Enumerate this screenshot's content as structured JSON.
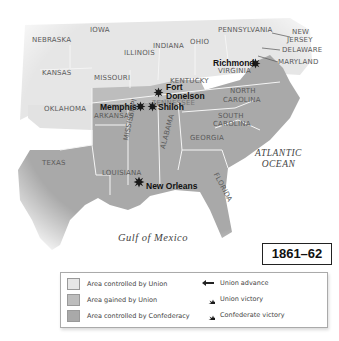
{
  "map": {
    "year_label": "1861–62",
    "colors": {
      "union": "#e6e6e6",
      "gained": "#bdbdbd",
      "confederacy": "#a9a9a9",
      "border": "#ffffff",
      "water": "#ffffff"
    },
    "states": {
      "nebraska": "NEBRASKA",
      "iowa": "IOWA",
      "illinois": "ILLINOIS",
      "indiana": "INDIANA",
      "ohio": "OHIO",
      "pennsylvania": "PENNSYLVANIA",
      "new_jersey_1": "NEW",
      "new_jersey_2": "JERSEY",
      "delaware": "DELAWARE",
      "maryland": "MARYLAND",
      "kansas": "KANSAS",
      "missouri": "MISSOURI",
      "kentucky": "KENTUCKY",
      "virginia": "VIRGINIA",
      "tennessee": "TENNESSEE",
      "north_carolina_1": "NORTH",
      "north_carolina_2": "CAROLINA",
      "oklahoma": "OKLAHOMA",
      "arkansas": "ARKANSAS",
      "south_carolina_1": "SOUTH",
      "south_carolina_2": "CAROLINA",
      "mississippi": "MISSISSIPPI",
      "alabama": "ALABAMA",
      "georgia": "GEORGIA",
      "texas": "TEXAS",
      "louisiana": "LOUISIANA",
      "florida": "FLORIDA"
    },
    "water": {
      "atlantic_1": "ATLANTIC",
      "atlantic_2": "OCEAN",
      "gulf": "Gulf of Mexico"
    },
    "battles": [
      {
        "name": "Richmond",
        "type": "Confederate victory"
      },
      {
        "name_1": "Fort",
        "name_2": "Donelson",
        "type": "Union victory"
      },
      {
        "name": "Memphis",
        "type": "Union victory"
      },
      {
        "name": "Shiloh",
        "type": "Union victory"
      },
      {
        "name": "New Orleans",
        "type": "Union victory"
      }
    ]
  },
  "legend": {
    "items": [
      {
        "label": "Area controlled by Union",
        "kind": "swatch",
        "color": "#e6e6e6"
      },
      {
        "label": "Area gained by Union",
        "kind": "swatch",
        "color": "#bdbdbd"
      },
      {
        "label": "Area controlled by Confederacy",
        "kind": "swatch",
        "color": "#a9a9a9"
      },
      {
        "label": "Union advance",
        "kind": "arrow-icon"
      },
      {
        "label": "Union victory",
        "kind": "explosion-icon"
      },
      {
        "label": "Confederate victory",
        "kind": "explosion-icon"
      }
    ]
  }
}
